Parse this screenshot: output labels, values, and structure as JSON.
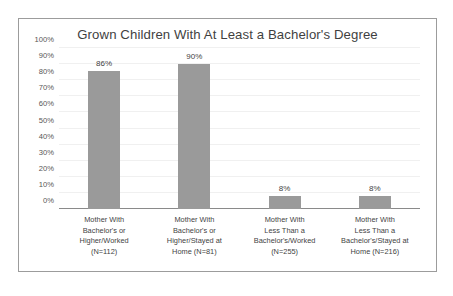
{
  "chart_data": {
    "type": "bar",
    "title": "Grown Children With At Least a Bachelor's Degree",
    "xlabel": "",
    "ylabel": "",
    "ylim": [
      0,
      100
    ],
    "grid": true,
    "legend": "none",
    "bar_color": "#9a9a9a",
    "categories": [
      "Mother With Bachelor's or Higher/Worked (N=112)",
      "Mother With Bachelor's or Higher/Stayed at Home (N=81)",
      "Mother With Less Than a Bachelor's/Worked (N=255)",
      "Mother With Less Than a Bachelor's/Stayed at Home (N=216)"
    ],
    "category_lines": [
      [
        "Mother With",
        "Bachelor's or",
        "Higher/Worked",
        "(N=112)"
      ],
      [
        "Mother With",
        "Bachelor's or",
        "Higher/Stayed at",
        "Home (N=81)"
      ],
      [
        "Mother With",
        "Less Than a",
        "Bachelor's/Worked",
        "(N=255)"
      ],
      [
        "Mother With",
        "Less Than a",
        "Bachelor's/Stayed at",
        "Home (N=216)"
      ]
    ],
    "values": [
      86,
      90,
      8,
      8
    ],
    "value_labels": [
      "86%",
      "90%",
      "8%",
      "8%"
    ],
    "sample_sizes": [
      112,
      81,
      255,
      216
    ],
    "yticks": [
      0,
      10,
      20,
      30,
      40,
      50,
      60,
      70,
      80,
      90,
      100
    ],
    "ytick_labels": [
      "0%",
      "10%",
      "20%",
      "30%",
      "40%",
      "50%",
      "60%",
      "70%",
      "80%",
      "90%",
      "100%"
    ]
  }
}
